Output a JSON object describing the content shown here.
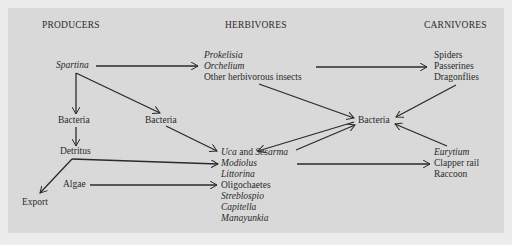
{
  "headers": {
    "producers": "PRODUCERS",
    "herbivores": "HERBIVORES",
    "carnivores": "CARNIVORES"
  },
  "producers": {
    "spartina": "Spartina",
    "bacteria_left": "Bacteria",
    "bacteria_mid": "Bacteria",
    "detritus": "Detritus",
    "algae": "Algae",
    "export": "Export"
  },
  "herbivores": {
    "insects": [
      "Prokelisia",
      "Orchelium",
      "Other herbivorous insects"
    ],
    "benthic": {
      "uca": "Uca",
      "and": " and ",
      "sesarma": "Sesarma",
      "list": [
        "Modiolus",
        "Littorina",
        "Oligochaetes",
        "Streblospio",
        "Capitella",
        "Manayunkia"
      ]
    }
  },
  "decomposers": {
    "bacteria_right": "Bacteria"
  },
  "carnivores": {
    "top": [
      "Spiders",
      "Passerines",
      "Dragonflies"
    ],
    "bottom": [
      "Eurytium",
      "Clapper rail",
      "Raccoon"
    ]
  },
  "colors": {
    "background": "#ececec",
    "panel": "#d9d9d9",
    "ink": "#2a2a2a"
  }
}
